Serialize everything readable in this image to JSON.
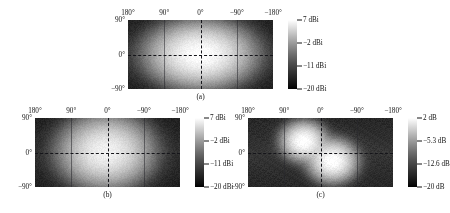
{
  "figure": {
    "type": "multi-panel-heatmap",
    "panel_count": 3,
    "background": "#ffffff",
    "colormap": "grayscale"
  },
  "chart_data": [
    {
      "type": "heatmap",
      "panel_id": "a",
      "caption": "(a)",
      "title": "",
      "xlabel": "",
      "ylabel": "",
      "xlim": [
        180,
        -180
      ],
      "ylim": [
        -90,
        90
      ],
      "xticks": [
        "180°",
        "90°",
        "0°",
        "−90°",
        "−180°"
      ],
      "xtick_values": [
        180,
        90,
        0,
        -90,
        -180
      ],
      "yticks": [
        "90°",
        "0°",
        "−90°"
      ],
      "ytick_values": [
        90,
        0,
        -90
      ],
      "grid": true,
      "crosshair": {
        "x": 0,
        "y": 0,
        "style": "dashed"
      },
      "colorbar": {
        "position": "right",
        "unit": "dBi",
        "min": -20,
        "max": 7,
        "ticks": [
          {
            "value": 7,
            "label": "7 dBi"
          },
          {
            "value": -2,
            "label": "−2 dBi"
          },
          {
            "value": -11,
            "label": "−11 dBi"
          },
          {
            "value": -20,
            "label": "−20 dBi"
          }
        ]
      },
      "lobes": [
        {
          "cx": 0,
          "cy": 0,
          "peak": 7,
          "sigma_x": 52,
          "sigma_y": 34
        }
      ],
      "description": "Single bright main lobe centred at boresight (0°, 0°) with broad horizontal spread"
    },
    {
      "type": "heatmap",
      "panel_id": "b",
      "caption": "(b)",
      "title": "",
      "xlabel": "",
      "ylabel": "",
      "xlim": [
        180,
        -180
      ],
      "ylim": [
        -90,
        90
      ],
      "xticks": [
        "180°",
        "90°",
        "0°",
        "−90°",
        "−180°"
      ],
      "xtick_values": [
        180,
        90,
        0,
        -90,
        -180
      ],
      "yticks": [
        "90°",
        "0°",
        "−90°"
      ],
      "ytick_values": [
        90,
        0,
        -90
      ],
      "grid": true,
      "crosshair": {
        "x": 0,
        "y": 0,
        "style": "dashed"
      },
      "colorbar": {
        "position": "right",
        "unit": "dBi",
        "min": -20,
        "max": 7,
        "ticks": [
          {
            "value": 7,
            "label": "7 dBi"
          },
          {
            "value": -2,
            "label": "−2 dBi"
          },
          {
            "value": -11,
            "label": "−11 dBi"
          },
          {
            "value": -20,
            "label": "−20 dBi"
          }
        ]
      },
      "lobes": [
        {
          "cx": 4,
          "cy": 2,
          "peak": 5.5,
          "sigma_x": 46,
          "sigma_y": 38
        }
      ],
      "description": "Single main lobe near boresight, slightly weaker and rounder than panel (a)"
    },
    {
      "type": "heatmap",
      "panel_id": "c",
      "caption": "(c)",
      "title": "",
      "xlabel": "",
      "ylabel": "",
      "xlim": [
        180,
        -180
      ],
      "ylim": [
        -90,
        90
      ],
      "xticks": [
        "180°",
        "90°",
        "0°",
        "−90°",
        "−180°"
      ],
      "xtick_values": [
        180,
        90,
        0,
        -90,
        -180
      ],
      "yticks": [
        "90°",
        "0°",
        "−90°"
      ],
      "ytick_values": [
        90,
        0,
        -90
      ],
      "grid": true,
      "crosshair": {
        "x": 0,
        "y": 0,
        "style": "dashed"
      },
      "colorbar": {
        "position": "right",
        "unit": "dB",
        "min": -20,
        "max": 2,
        "ticks": [
          {
            "value": 2,
            "label": "2 dB"
          },
          {
            "value": -5.3,
            "label": "−5.3 dB"
          },
          {
            "value": -12.6,
            "label": "−12.6 dB"
          },
          {
            "value": -20,
            "label": "−20 dB"
          }
        ]
      },
      "lobes": [
        {
          "cx": 42,
          "cy": 30,
          "peak": 2,
          "sigma_x": 24,
          "sigma_y": 22
        },
        {
          "cx": -30,
          "cy": -22,
          "peak": 2,
          "sigma_x": 26,
          "sigma_y": 24
        }
      ],
      "description": "Two distinct bright lobes: one upper-left of boresight near (42°, 30°) and one lower-right near (−30°, −22°)"
    }
  ]
}
